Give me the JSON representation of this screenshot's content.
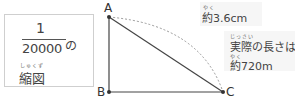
{
  "scale_box": {
    "numerator": "1",
    "denominator": "20000",
    "particle": "の",
    "ruby": "しゅくず",
    "word": "縮図"
  },
  "diagram": {
    "points": {
      "A": "A",
      "B": "B",
      "C": "C"
    },
    "arc_label": {
      "ruby": "やく",
      "text": "約3.6cm"
    },
    "actual_label": {
      "ruby1": "じっさい",
      "line1": "実際の長さは",
      "ruby2": "やく",
      "line2": "約720m"
    }
  }
}
